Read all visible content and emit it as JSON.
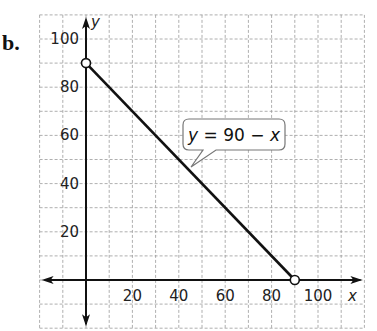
{
  "part_label": "b.",
  "axes": {
    "x_label": "x",
    "y_label": "y",
    "x_range": [
      -20,
      120
    ],
    "y_range": [
      -20,
      110
    ],
    "grid_step": 10,
    "x_ticks": [
      "20",
      "40",
      "60",
      "80",
      "100"
    ],
    "y_ticks": [
      "20",
      "40",
      "60",
      "80",
      "100"
    ]
  },
  "callout": {
    "text_y": "y",
    "text_rest": " = 90 − ",
    "text_x": "x"
  },
  "chart_data": {
    "type": "line",
    "title": "",
    "xlabel": "x",
    "ylabel": "y",
    "xlim": [
      -20,
      120
    ],
    "ylim": [
      -20,
      110
    ],
    "grid": true,
    "series": [
      {
        "name": "y = 90 − x",
        "x": [
          0,
          90
        ],
        "y": [
          90,
          0
        ],
        "endpoints": "open circles"
      }
    ],
    "annotations": [
      "y = 90 − x"
    ],
    "x_ticks": [
      20,
      40,
      60,
      80,
      100
    ],
    "y_ticks": [
      20,
      40,
      60,
      80,
      100
    ]
  },
  "colors": {
    "grid": "#9a9a9a",
    "axis": "#111111",
    "line": "#111111"
  }
}
